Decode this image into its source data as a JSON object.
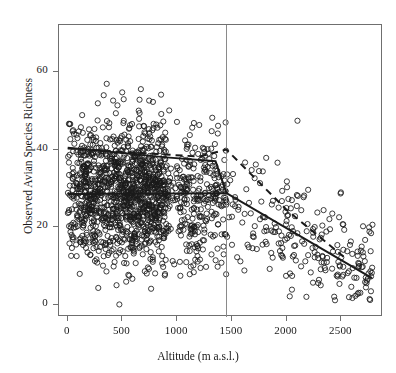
{
  "chart_data": {
    "type": "scatter",
    "title": "",
    "xlabel": "Altitude (m a.s.l.)",
    "ylabel": "Observed Avian Species Richness",
    "xlim": [
      -80,
      2880
    ],
    "ylim": [
      -3,
      72
    ],
    "xticks": [
      0,
      500,
      1000,
      1500,
      2000,
      2500
    ],
    "xtick_labels": [
      "0",
      "500",
      "1000",
      "1500",
      "2000",
      "2500"
    ],
    "yticks": [
      0,
      20,
      40,
      60
    ],
    "ytick_labels": [
      "0",
      "20",
      "40",
      "60"
    ],
    "grid": false,
    "legend": false,
    "marker": "open-circle",
    "marker_color": "#1a1a1a",
    "point_count": 1750,
    "annotations": [
      {
        "name": "breakpoint-line",
        "type": "vertical-line",
        "x": 1450,
        "style": "solid",
        "color": "#8a8a8a"
      }
    ],
    "fits": [
      {
        "name": "segmented-fit-solid",
        "style": "solid",
        "color": "#1a1a1a",
        "width": 2.0,
        "points": [
          [
            0,
            40.5
          ],
          [
            900,
            38.0
          ],
          [
            1350,
            37.0
          ],
          [
            1450,
            28.8
          ],
          [
            2780,
            7.0
          ]
        ]
      },
      {
        "name": "segmented-fit-dashed",
        "style": "dashed",
        "color": "#1a1a1a",
        "width": 2.0,
        "points": [
          [
            0,
            40.3
          ],
          [
            1200,
            38.2
          ],
          [
            1450,
            40.0
          ],
          [
            2000,
            24.5
          ],
          [
            2520,
            12.5
          ]
        ]
      },
      {
        "name": "low-altitude-plateau-solid",
        "style": "solid",
        "color": "#1a1a1a",
        "width": 2.0,
        "points": [
          [
            0,
            28.6
          ],
          [
            1450,
            28.8
          ]
        ]
      }
    ]
  }
}
